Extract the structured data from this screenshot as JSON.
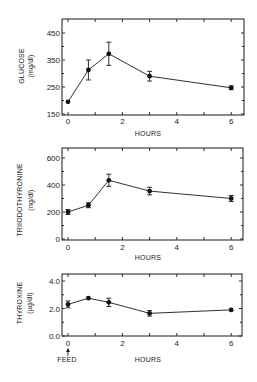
{
  "chart_data": [
    {
      "type": "line",
      "title": "",
      "xlabel": "HOURS",
      "ylabel": "GLUCOSE",
      "yunits": "(mg/dl)",
      "x": [
        0,
        0.75,
        1.5,
        3,
        6
      ],
      "values": [
        195,
        313,
        373,
        290,
        247
      ],
      "error": [
        5,
        37,
        43,
        18,
        7
      ],
      "xlim": [
        0,
        6.5
      ],
      "ylim": [
        150,
        500
      ],
      "xticks": [
        "0",
        "2",
        "4",
        "6"
      ],
      "yticks": [
        "150",
        "250",
        "350",
        "450"
      ],
      "grid": false
    },
    {
      "type": "line",
      "title": "",
      "xlabel": "HOURS",
      "ylabel": "TRIIODOTHYRONINE",
      "yunits": "(ng/dl)",
      "x": [
        0,
        0.75,
        1.5,
        3,
        6
      ],
      "values": [
        200,
        250,
        435,
        355,
        300
      ],
      "error": [
        18,
        18,
        45,
        28,
        22
      ],
      "xlim": [
        0,
        6.5
      ],
      "ylim": [
        0,
        650
      ],
      "xticks": [
        "0",
        "2",
        "4",
        "6"
      ],
      "yticks": [
        "0",
        "200",
        "400",
        "600"
      ],
      "grid": false
    },
    {
      "type": "line",
      "title": "",
      "xlabel": "HOURS",
      "ylabel": "THYROXINE",
      "yunits": "(µg/dl)",
      "x": [
        0,
        0.75,
        1.5,
        3,
        6
      ],
      "values": [
        2.3,
        2.75,
        2.45,
        1.65,
        1.9
      ],
      "error": [
        0.25,
        0.05,
        0.3,
        0.2,
        0.05
      ],
      "xlim": [
        0,
        6.5
      ],
      "ylim": [
        0,
        4.5
      ],
      "xticks": [
        "0",
        "2",
        "4",
        "6"
      ],
      "yticks": [
        "0.0",
        "2.0",
        "4.0"
      ],
      "annotations": [
        {
          "text": "FEED",
          "x": 0,
          "arrow": "up"
        }
      ],
      "grid": false
    }
  ],
  "labels": {
    "feed": "FEED",
    "hours": "HOURS"
  }
}
